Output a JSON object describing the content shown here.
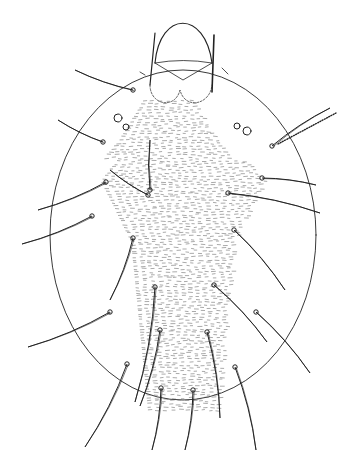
{
  "figure": {
    "alt": "Line drawing of a mite, dorsal view, oval body with long setae and striated central region",
    "colors": {
      "ink": "#222222",
      "background": "#ffffff"
    },
    "setae": [
      {
        "base": [
          103,
          142
        ],
        "tip": [
          58,
          120
        ]
      },
      {
        "base": [
          133,
          90
        ],
        "tip": [
          75,
          70
        ]
      },
      {
        "base": [
          106,
          182
        ],
        "tip": [
          38,
          210
        ]
      },
      {
        "base": [
          148,
          195
        ],
        "tip": [
          110,
          170
        ]
      },
      {
        "base": [
          150,
          190
        ],
        "tip": [
          150,
          140
        ]
      },
      {
        "base": [
          92,
          216
        ],
        "tip": [
          22,
          244
        ]
      },
      {
        "base": [
          133,
          238
        ],
        "tip": [
          110,
          300
        ]
      },
      {
        "base": [
          110,
          312
        ],
        "tip": [
          28,
          347
        ]
      },
      {
        "base": [
          155,
          287
        ],
        "tip": [
          135,
          402
        ]
      },
      {
        "base": [
          127,
          364
        ],
        "tip": [
          85,
          447
        ]
      },
      {
        "base": [
          161,
          388
        ],
        "tip": [
          152,
          450
        ]
      },
      {
        "base": [
          160,
          330
        ],
        "tip": [
          140,
          406
        ]
      },
      {
        "base": [
          193,
          390
        ],
        "tip": [
          185,
          450
        ]
      },
      {
        "base": [
          207,
          332
        ],
        "tip": [
          220,
          418
        ]
      },
      {
        "base": [
          214,
          285
        ],
        "tip": [
          267,
          342
        ]
      },
      {
        "base": [
          235,
          367
        ],
        "tip": [
          256,
          450
        ]
      },
      {
        "base": [
          256,
          312
        ],
        "tip": [
          310,
          373
        ]
      },
      {
        "base": [
          234,
          230
        ],
        "tip": [
          285,
          290
        ]
      },
      {
        "base": [
          228,
          193
        ],
        "tip": [
          320,
          213
        ]
      },
      {
        "base": [
          262,
          178
        ],
        "tip": [
          316,
          185
        ]
      },
      {
        "base": [
          272,
          146
        ],
        "tip": [
          330,
          108
        ]
      }
    ]
  }
}
